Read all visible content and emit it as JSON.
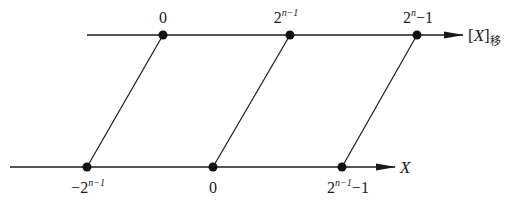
{
  "diagram": {
    "colors": {
      "stroke": "#1a1a1a",
      "dot": "#111111",
      "background": "#ffffff"
    },
    "top_axis": {
      "label_prefix": "[",
      "label_var": "X",
      "label_suffix": "]",
      "label_sub": "移",
      "points": [
        {
          "base": "0",
          "sup": "",
          "tail": ""
        },
        {
          "base": "2",
          "sup": "n−1",
          "tail": ""
        },
        {
          "base": "2",
          "sup": "n",
          "tail": "−1"
        }
      ]
    },
    "bottom_axis": {
      "label_var": "X",
      "points": [
        {
          "base": "−2",
          "sup": "n−1",
          "tail": ""
        },
        {
          "base": "0",
          "sup": "",
          "tail": ""
        },
        {
          "base": "2",
          "sup": "n−1",
          "tail": "−1"
        }
      ]
    },
    "connections": [
      {
        "from": "bottom_axis.points.0",
        "to": "top_axis.points.0"
      },
      {
        "from": "bottom_axis.points.1",
        "to": "top_axis.points.1"
      },
      {
        "from": "bottom_axis.points.2",
        "to": "top_axis.points.2"
      }
    ]
  }
}
